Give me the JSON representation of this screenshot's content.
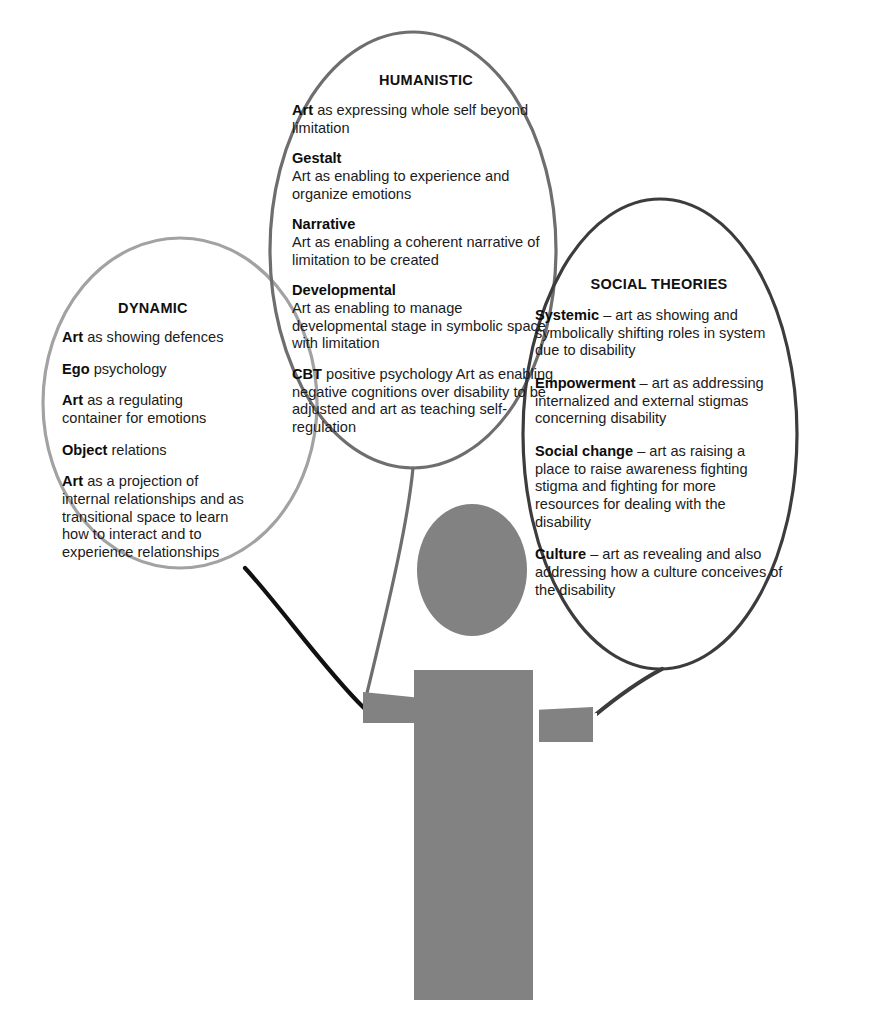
{
  "diagram": {
    "colors": {
      "dynamic_stroke": "#a2a2a2",
      "humanistic_stroke": "#6e6e6e",
      "social_stroke": "#3c3c3c",
      "figure_fill": "#828282",
      "figure_shadow": "#ffffff",
      "connector_dark": "#111111",
      "text": "#1b1b1b",
      "background": "#ffffff"
    },
    "bubbles": [
      {
        "id": "dynamic",
        "title": "DYNAMIC",
        "entries": [
          {
            "lead": "Art",
            "rest": " as showing defences"
          },
          {
            "lead": "Ego",
            "rest": " psychology"
          },
          {
            "lead": "Art",
            "rest": " as a regulating container for emotions"
          },
          {
            "lead": "Object",
            "rest": " relations"
          },
          {
            "lead": "Art",
            "rest": " as a projection of internal relationships and as transitional space to learn how to interact and to experience relationships"
          }
        ]
      },
      {
        "id": "humanistic",
        "title": "HUMANISTIC",
        "entries": [
          {
            "lead": "Art",
            "rest": " as expressing whole self beyond limitation"
          },
          {
            "lead": "Gestalt",
            "rest": "\nArt as enabling to experience and organize emotions"
          },
          {
            "lead": "Narrative",
            "rest": "\nArt as enabling a coherent narrative of limitation to be created"
          },
          {
            "lead": "Developmental",
            "rest": "\nArt as enabling to manage developmental stage in symbolic space with limitation"
          },
          {
            "lead": "CBT",
            "rest": " positive psychology\nArt as enabling negative cognitions over disability to be adjusted and art as teaching self-regulation"
          }
        ]
      },
      {
        "id": "social",
        "title": "SOCIAL THEORIES",
        "entries": [
          {
            "lead": "Systemic",
            "rest": " – art as showing and symbolically shifting roles in system due to disability"
          },
          {
            "lead": "Empowerment",
            "rest": " – art as addressing internalized and external stigmas concerning disability"
          },
          {
            "lead": "Social change",
            "rest": " – art as raising a place to raise awareness fighting stigma and fighting for more resources for dealing with the disability"
          },
          {
            "lead": "Culture",
            "rest": " – art as revealing and also addressing how a culture conceives of the disability"
          }
        ]
      }
    ],
    "figure": {
      "name": "person-figure",
      "parts": [
        "head",
        "torso",
        "left-arm",
        "right-arm",
        "left-leg",
        "right-leg"
      ]
    },
    "connectors": [
      {
        "name": "dynamic-to-left-hand",
        "from": "dynamic",
        "to": "left-hand"
      },
      {
        "name": "humanistic-tail-to-left-shoulder",
        "from": "humanistic",
        "to": "left-shoulder"
      },
      {
        "name": "social-to-right-hand",
        "from": "social",
        "to": "right-hand"
      }
    ]
  }
}
